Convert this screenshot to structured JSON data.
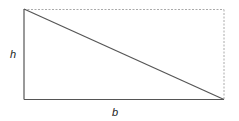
{
  "diagram": {
    "type": "right-triangle-in-rectangle",
    "labels": {
      "height": "h",
      "base": "b"
    },
    "colors": {
      "solid_line": "#555555",
      "dashed_line": "#aaaaaa",
      "text": "#222222"
    }
  }
}
